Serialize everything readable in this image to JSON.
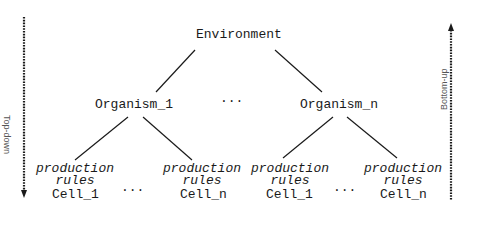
{
  "diagram": {
    "root": {
      "label": "Environment"
    },
    "organisms": [
      {
        "label": "Organism_1"
      },
      {
        "label": "Organism_n"
      }
    ],
    "organism_ellipsis": "...",
    "cells": [
      {
        "rules_line1": "production",
        "rules_line2": "rules",
        "label": "Cell_1"
      },
      {
        "rules_line1": "production",
        "rules_line2": "rules",
        "label": "Cell_n"
      },
      {
        "rules_line1": "production",
        "rules_line2": "rules",
        "label": "Cell_1"
      },
      {
        "rules_line1": "production",
        "rules_line2": "rules",
        "label": "Cell_n"
      }
    ],
    "cell_ellipsis": [
      "...",
      "..."
    ],
    "left_axis": {
      "label": "Top-down",
      "direction": "down"
    },
    "right_axis": {
      "label": "Bottom-up",
      "direction": "up"
    },
    "colors": {
      "line": "#1a1a1a",
      "text": "#1a1a1a",
      "axis_label": "#555555"
    }
  }
}
